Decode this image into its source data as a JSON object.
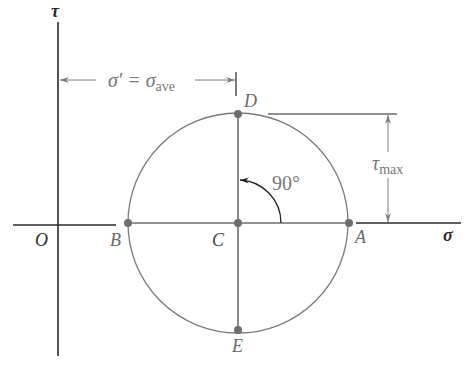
{
  "diagram": {
    "axes": {
      "vertical_label": "τ",
      "horizontal_label": "σ",
      "origin_label": "O"
    },
    "points": {
      "A": "A",
      "B": "B",
      "C": "C",
      "D": "D",
      "E": "E"
    },
    "dimensions": {
      "sigma_prime": "σ′ = σ",
      "sigma_sub": "ave",
      "tau": "τ",
      "tau_sub": "max",
      "angle": "90°"
    },
    "colors": {
      "axis": "#2a2a2a",
      "circle": "#7a7a7a",
      "point": "#6e6e6e",
      "label": "#6a6a6a"
    }
  }
}
